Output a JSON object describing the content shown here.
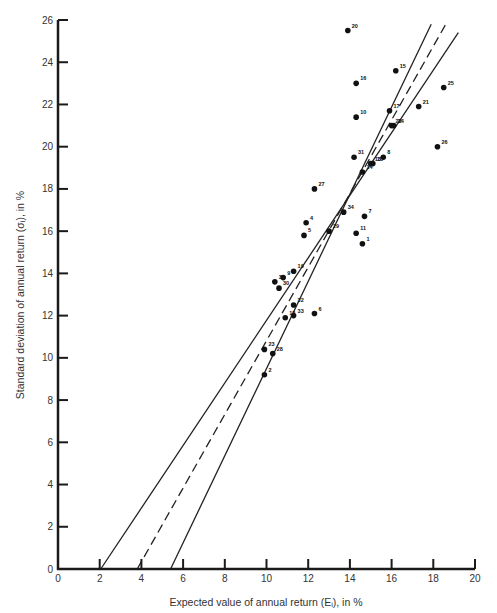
{
  "chart_data": {
    "type": "scatter",
    "title": "",
    "xlabel": "Expected value of annual return (Eᵢ), in %",
    "ylabel": "Standard deviation of annual return (σᵢ), in %",
    "xlim": [
      0,
      20
    ],
    "ylim": [
      0,
      26
    ],
    "xticks": [
      0,
      2,
      4,
      6,
      8,
      10,
      12,
      14,
      16,
      18,
      20
    ],
    "yticks": [
      0,
      2,
      4,
      6,
      8,
      10,
      12,
      14,
      16,
      18,
      20,
      22,
      24,
      26
    ],
    "grid": false,
    "legend": null,
    "points": [
      {
        "label": "1",
        "x": 14.6,
        "y": 15.4
      },
      {
        "label": "2",
        "x": 9.9,
        "y": 9.2
      },
      {
        "label": "3",
        "x": 10.4,
        "y": 13.6
      },
      {
        "label": "4",
        "x": 11.9,
        "y": 16.4
      },
      {
        "label": "5",
        "x": 11.8,
        "y": 15.8
      },
      {
        "label": "6",
        "x": 12.3,
        "y": 12.1
      },
      {
        "label": "7",
        "x": 14.7,
        "y": 16.7
      },
      {
        "label": "8",
        "x": 15.6,
        "y": 19.5
      },
      {
        "label": "9",
        "x": 10.8,
        "y": 13.8
      },
      {
        "label": "10",
        "x": 14.3,
        "y": 21.4
      },
      {
        "label": "11",
        "x": 14.3,
        "y": 15.9
      },
      {
        "label": "12",
        "x": 10.9,
        "y": 11.9
      },
      {
        "label": "13",
        "x": 15.0,
        "y": 19.2
      },
      {
        "label": "14",
        "x": 14.6,
        "y": 18.8
      },
      {
        "label": "15",
        "x": 16.2,
        "y": 23.6
      },
      {
        "label": "16",
        "x": 14.3,
        "y": 23.0
      },
      {
        "label": "17",
        "x": 15.9,
        "y": 21.7
      },
      {
        "label": "18",
        "x": 15.1,
        "y": 19.2
      },
      {
        "label": "19",
        "x": 11.3,
        "y": 14.1
      },
      {
        "label": "20",
        "x": 13.9,
        "y": 25.5
      },
      {
        "label": "21",
        "x": 17.3,
        "y": 21.9
      },
      {
        "label": "22",
        "x": 16.0,
        "y": 21.0
      },
      {
        "label": "23",
        "x": 9.9,
        "y": 10.4
      },
      {
        "label": "24",
        "x": 16.1,
        "y": 21.0
      },
      {
        "label": "25",
        "x": 18.5,
        "y": 22.8
      },
      {
        "label": "26",
        "x": 18.2,
        "y": 20.0
      },
      {
        "label": "27",
        "x": 12.3,
        "y": 18.0
      },
      {
        "label": "28",
        "x": 10.3,
        "y": 10.2
      },
      {
        "label": "29",
        "x": 13.0,
        "y": 16.0
      },
      {
        "label": "30",
        "x": 10.6,
        "y": 13.3
      },
      {
        "label": "31",
        "x": 14.2,
        "y": 19.5
      },
      {
        "label": "32",
        "x": 11.3,
        "y": 12.5
      },
      {
        "label": "33",
        "x": 11.3,
        "y": 12.0
      },
      {
        "label": "34",
        "x": 13.7,
        "y": 16.9
      }
    ],
    "lines": [
      {
        "name": "left-solid",
        "style": "solid",
        "x1": 2.05,
        "y1": 0,
        "x2": 19.2,
        "y2": 25.4
      },
      {
        "name": "regression-dashed",
        "style": "dashed",
        "x1": 3.8,
        "y1": 0,
        "x2": 18.6,
        "y2": 25.8
      },
      {
        "name": "right-solid",
        "style": "solid",
        "x1": 5.4,
        "y1": 0,
        "x2": 17.9,
        "y2": 25.8
      }
    ]
  },
  "layout": {
    "plot_left": 58,
    "plot_right": 475,
    "plot_top": 20,
    "plot_bottom": 569,
    "axis_color": "#1a1a1a",
    "point_color": "#111111",
    "line_color": "#222222"
  }
}
